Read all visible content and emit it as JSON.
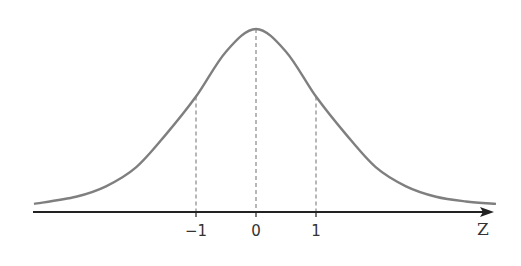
{
  "chart_data": {
    "type": "line",
    "title": "",
    "subtitle": "",
    "xlabel": "Z",
    "ylabel": "",
    "x_ticks": [
      "-1",
      "0",
      "1"
    ],
    "x_tick_values": [
      -1,
      0,
      1
    ],
    "xlim": [
      -3.7,
      4.0
    ],
    "grid": false,
    "legend": null,
    "series": [
      {
        "name": "density curve",
        "color": "#7f7f7f",
        "x": [
          -3.7,
          -3.0,
          -2.5,
          -2.0,
          -1.5,
          -1.0,
          -0.5,
          0.0,
          0.5,
          1.0,
          1.5,
          2.0,
          2.5,
          3.0,
          3.5,
          4.0
        ],
        "y": [
          0.013,
          0.028,
          0.05,
          0.09,
          0.16,
          0.24,
          0.335,
          0.383,
          0.335,
          0.24,
          0.16,
          0.09,
          0.05,
          0.028,
          0.018,
          0.013
        ]
      }
    ],
    "reference_lines": [
      {
        "x": -1,
        "style": "dashed",
        "color": "#888888"
      },
      {
        "x": 0,
        "style": "dashed",
        "color": "#888888"
      },
      {
        "x": 1,
        "style": "dashed",
        "color": "#888888"
      }
    ],
    "axis": {
      "color": "#222222",
      "arrow": true
    }
  },
  "labels": {
    "tick_minus_one": "−1",
    "tick_zero": "0",
    "tick_one": "1",
    "axis_z": "Z"
  }
}
